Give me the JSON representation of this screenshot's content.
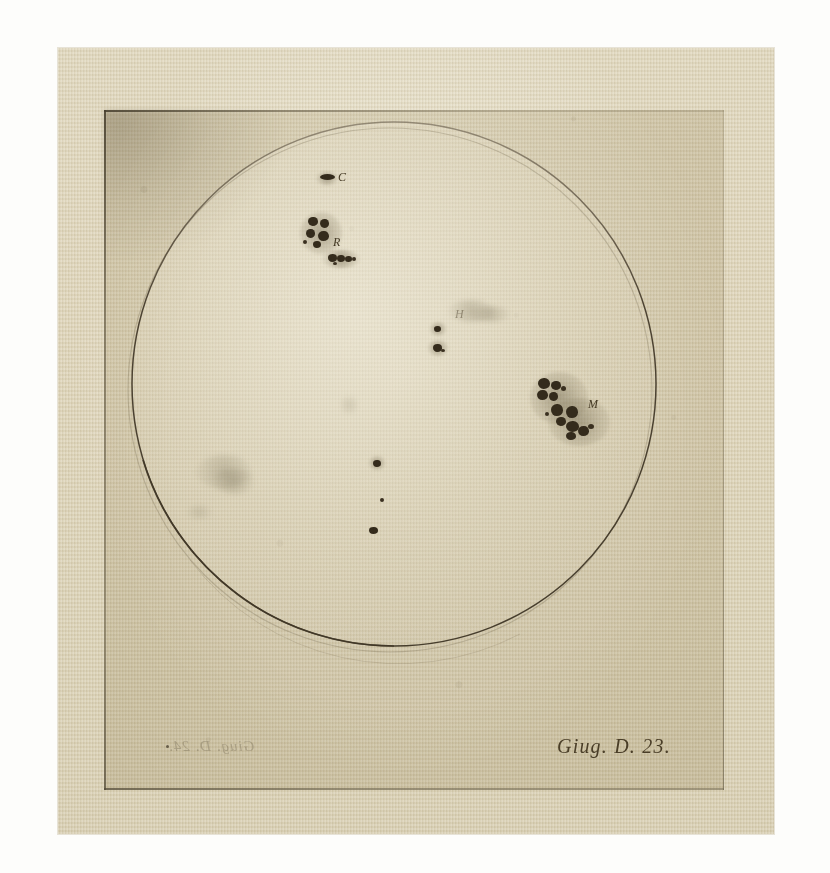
{
  "artwork": {
    "title": "Sunspot observation engraving",
    "medium_note": "etching on laid paper",
    "caption": "Giug. D. 23.",
    "ghost_caption": "Giug. D. 24.",
    "paper_color": "#dcd2b5",
    "margin_color": "#fdfdfb",
    "ink_color": "#3a3020",
    "plate_tone": "#cdc4aa"
  },
  "disk": {
    "name": "solar-disk",
    "center_x": 394,
    "center_y": 384,
    "radius": 262,
    "outline_color": "#4a4030"
  },
  "labels": [
    {
      "id": "C",
      "text": "C",
      "x": 338,
      "y": 172,
      "group": "spot-group-c"
    },
    {
      "id": "R",
      "text": "R",
      "x": 333,
      "y": 238,
      "group": "spot-group-r"
    },
    {
      "id": "M",
      "text": "M",
      "x": 588,
      "y": 398,
      "group": "spot-group-m"
    },
    {
      "id": "H",
      "text": "H",
      "x": 455,
      "y": 310,
      "group": "spot-group-h"
    }
  ],
  "spot_groups": [
    {
      "id": "spot-group-c",
      "label": "C",
      "description": "single small elongated spot near upper limb",
      "center": [
        327,
        178
      ]
    },
    {
      "id": "spot-group-r",
      "label": "R",
      "description": "compact four-lobed cluster with trailing linear chain below",
      "center": [
        320,
        235
      ]
    },
    {
      "id": "spot-group-h",
      "label": "H",
      "description": "two small spots with faint diffuse streak",
      "center": [
        440,
        330
      ]
    },
    {
      "id": "spot-group-m",
      "label": "M",
      "description": "large diagonal chain of clustered spots with penumbrae",
      "center": [
        565,
        405
      ]
    },
    {
      "id": "spot-group-faint-west",
      "label": "",
      "description": "faint diffuse grey smudge, lower left quadrant",
      "center": [
        222,
        478
      ]
    },
    {
      "id": "spot-group-center-chain",
      "label": "",
      "description": "three tiny isolated spots in a vertical line near disk centre",
      "center": [
        378,
        475
      ]
    }
  ]
}
